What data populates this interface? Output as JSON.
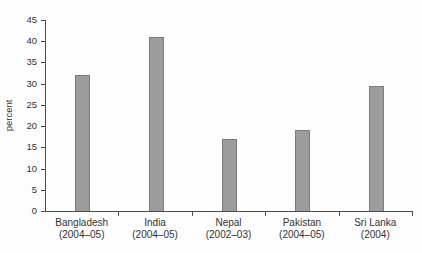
{
  "chart_data": {
    "type": "bar",
    "title": "",
    "xlabel": "",
    "ylabel": "percent",
    "categories": [
      "Bangladesh",
      "India",
      "Nepal",
      "Pakistan",
      "Sri Lanka"
    ],
    "category_periods": [
      "(2004–05)",
      "(2004–05)",
      "(2002–03)",
      "(2004–05)",
      "(2004)"
    ],
    "values": [
      32,
      41,
      17,
      19,
      29.5
    ],
    "ylim": [
      0,
      45
    ],
    "yticks": [
      0,
      5,
      10,
      15,
      20,
      25,
      30,
      35,
      40,
      45
    ],
    "grid": false,
    "legend": "none",
    "bar_color": "#9c9c9c",
    "bar_border_color": "#7d7d7d",
    "axis_color": "#4d4d4d",
    "text_color": "#333333",
    "background_color": "#fdfdfd"
  }
}
